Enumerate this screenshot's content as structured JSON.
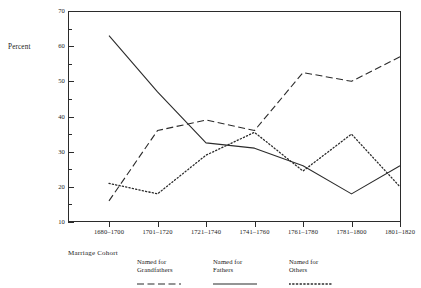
{
  "chart_data": {
    "type": "line",
    "title": "",
    "xlabel": "Marriage Cohort",
    "ylabel": "Percent",
    "categories": [
      "1680–1700",
      "1701–1720",
      "1721–1740",
      "1741–1760",
      "1761–1780",
      "1781–1800",
      "1801–1820"
    ],
    "ylim": [
      10,
      70
    ],
    "ytick_labels": [
      "10",
      "20",
      "30",
      "40",
      "50",
      "60",
      "70"
    ],
    "ytick_values": [
      10,
      20,
      30,
      40,
      50,
      60,
      70
    ],
    "yminor_values": [
      15,
      25,
      35,
      45,
      55,
      65
    ],
    "grid": false,
    "legend_position": "below-axis",
    "series": [
      {
        "name": "Named for Grandfathers",
        "style": "dashed",
        "color": "#2b2b2b",
        "values": [
          16,
          36,
          39,
          36,
          52.5,
          50,
          57
        ]
      },
      {
        "name": "Named for Fathers",
        "style": "solid",
        "color": "#2b2b2b",
        "values": [
          63,
          47,
          32.5,
          31,
          26,
          18,
          26
        ]
      },
      {
        "name": "Named for Others",
        "style": "dotted",
        "color": "#2b2b2b",
        "values": [
          21,
          18,
          29,
          35.5,
          24.5,
          35,
          20
        ]
      }
    ]
  },
  "legend": {
    "entries": [
      {
        "line1": "Named for",
        "line2": "Grandfathers",
        "style": "dashed"
      },
      {
        "line1": "Named for",
        "line2": "Fathers",
        "style": "solid"
      },
      {
        "line1": "Named for",
        "line2": "Others",
        "style": "dotted"
      }
    ]
  }
}
